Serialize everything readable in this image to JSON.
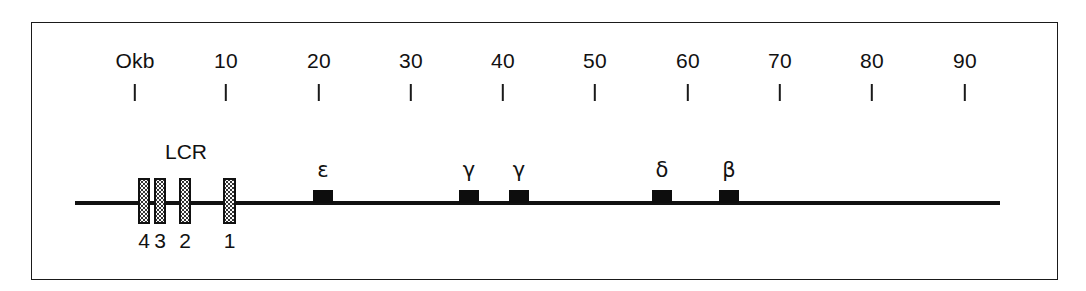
{
  "figure": {
    "width": 1086,
    "height": 291,
    "background_color": "#ffffff",
    "frame_color": "#1a1a1a",
    "line_color": "#111111"
  },
  "chart_data": {
    "type": "diagram",
    "xlabel": "Okb",
    "ylabel": "",
    "xlim": [
      0,
      90
    ],
    "axis_unit": "kb",
    "grid": false,
    "legend": "none",
    "scale": {
      "tick_labels": [
        "Okb",
        "10",
        "20",
        "30",
        "40",
        "50",
        "60",
        "70",
        "80",
        "90"
      ],
      "tick_values": [
        0,
        10,
        20,
        30,
        40,
        50,
        60,
        70,
        80,
        90
      ],
      "tick_pixel_x": [
        135,
        226,
        319,
        411,
        503,
        595,
        688,
        780,
        872,
        965
      ]
    },
    "backbone": {
      "start_kb": -6.5,
      "end_kb": 94,
      "pixel_left": 75,
      "pixel_right": 1000
    },
    "lcr": {
      "label": "LCR",
      "label_pixel_x": 186,
      "elements": [
        {
          "name": "4",
          "center_kb": 0.4,
          "pixel_left": 138,
          "width": 12
        },
        {
          "name": "3",
          "center_kb": 2.1,
          "pixel_left": 154,
          "width": 12
        },
        {
          "name": "2",
          "center_kb": 4.8,
          "pixel_left": 179,
          "width": 12
        },
        {
          "name": "1",
          "center_kb": 9.6,
          "pixel_left": 223,
          "width": 13
        }
      ],
      "style": "stippled box with black outline"
    },
    "genes": [
      {
        "label": "ε",
        "name": "epsilon",
        "center_kb": 20.4,
        "pixel_left": 313,
        "width": 20
      },
      {
        "label": "γ",
        "name": "gamma-G",
        "center_kb": 36.2,
        "pixel_left": 459,
        "width": 20
      },
      {
        "label": "γ",
        "name": "gamma-A",
        "center_kb": 41.6,
        "pixel_left": 509,
        "width": 20
      },
      {
        "label": "δ",
        "name": "delta",
        "center_kb": 57.1,
        "pixel_left": 652,
        "width": 20
      },
      {
        "label": "β",
        "name": "beta",
        "center_kb": 64.4,
        "pixel_left": 719,
        "width": 20
      }
    ]
  }
}
